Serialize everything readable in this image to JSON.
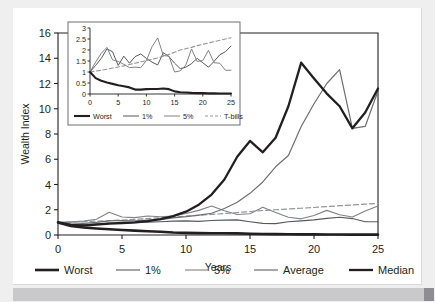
{
  "figure": {
    "background_color": "#efeff0",
    "card_color": "#ffffff",
    "footer_color": "#c9c9cc"
  },
  "chart_data": {
    "type": "line",
    "title": "",
    "xlabel": "Years",
    "ylabel": "Wealth Index",
    "xlim": [
      0,
      25
    ],
    "ylim": [
      0,
      16
    ],
    "grid": false,
    "legend_position": "bottom",
    "xticks": [
      "0",
      "5",
      "10",
      "15",
      "20",
      "25"
    ],
    "yticks": [
      "0",
      "2",
      "4",
      "6",
      "8",
      "10",
      "12",
      "14",
      "16"
    ],
    "x": [
      0,
      1,
      2,
      3,
      4,
      5,
      6,
      7,
      8,
      9,
      10,
      11,
      12,
      13,
      14,
      15,
      16,
      17,
      18,
      19,
      20,
      21,
      22,
      23,
      24,
      25
    ],
    "series": [
      {
        "name": "Worst",
        "color": "#231f20",
        "width": 2.6,
        "dash": "none",
        "values": [
          1.0,
          0.72,
          0.6,
          0.52,
          0.46,
          0.4,
          0.35,
          0.3,
          0.26,
          0.2,
          0.17,
          0.15,
          0.14,
          0.14,
          0.13,
          0.1,
          0.08,
          0.07,
          0.06,
          0.05,
          0.05,
          0.04,
          0.04,
          0.03,
          0.03,
          0.03
        ]
      },
      {
        "name": "1%",
        "color": "#58595b",
        "width": 1.1,
        "dash": "none",
        "values": [
          1.0,
          0.85,
          0.82,
          0.88,
          0.95,
          0.92,
          0.98,
          1.02,
          1.05,
          1.1,
          1.12,
          1.08,
          1.15,
          1.18,
          1.2,
          1.05,
          0.92,
          0.9,
          1.05,
          1.12,
          1.2,
          1.32,
          1.4,
          1.3,
          1.05,
          1.05
        ]
      },
      {
        "name": "5%",
        "color": "#808285",
        "width": 1.1,
        "dash": "none",
        "values": [
          1.0,
          1.05,
          1.1,
          1.25,
          1.8,
          1.42,
          1.38,
          1.5,
          1.45,
          1.5,
          1.7,
          1.95,
          2.3,
          1.92,
          1.62,
          1.68,
          2.2,
          1.78,
          1.4,
          1.28,
          1.55,
          1.95,
          1.6,
          1.42,
          1.9,
          2.3
        ]
      },
      {
        "name": "Average",
        "color": "#6d6e71",
        "width": 1.2,
        "dash": "none",
        "values": [
          1.0,
          0.95,
          0.92,
          1.0,
          1.12,
          1.15,
          1.12,
          1.18,
          1.22,
          1.35,
          1.45,
          1.58,
          1.72,
          2.1,
          2.6,
          3.3,
          4.2,
          5.4,
          6.3,
          8.6,
          10.4,
          12.0,
          13.1,
          8.45,
          8.6,
          11.4
        ]
      },
      {
        "name": "Median",
        "color": "#231f20",
        "width": 2.3,
        "dash": "none",
        "values": [
          1.0,
          0.8,
          0.75,
          0.82,
          0.9,
          0.95,
          1.0,
          1.1,
          1.25,
          1.5,
          1.85,
          2.4,
          3.2,
          4.4,
          6.2,
          7.45,
          6.55,
          7.7,
          10.2,
          13.65,
          12.4,
          11.2,
          10.2,
          8.45,
          9.7,
          11.6
        ]
      },
      {
        "name": "T-bills",
        "color": "#939598",
        "width": 1.2,
        "dash": "5,3",
        "values": [
          1.0,
          1.03,
          1.06,
          1.1,
          1.14,
          1.19,
          1.24,
          1.3,
          1.36,
          1.42,
          1.49,
          1.56,
          1.63,
          1.7,
          1.78,
          1.86,
          1.94,
          2.0,
          2.06,
          2.12,
          2.18,
          2.25,
          2.32,
          2.38,
          2.44,
          2.5
        ]
      }
    ],
    "legend": [
      {
        "label": "Worst",
        "color": "#231f20",
        "width": 2.6,
        "dash": "none"
      },
      {
        "label": "1%",
        "color": "#58595b",
        "width": 1.1,
        "dash": "none"
      },
      {
        "label": "5%",
        "color": "#808285",
        "width": 1.1,
        "dash": "none"
      },
      {
        "label": "Average",
        "color": "#6d6e71",
        "width": 1.2,
        "dash": "none"
      },
      {
        "label": "Median",
        "color": "#231f20",
        "width": 2.3,
        "dash": "none"
      },
      {
        "label": "T-bills",
        "color": "#939598",
        "width": 1.2,
        "dash": "4,2.5"
      }
    ],
    "inset": {
      "type": "line",
      "xlabel": "",
      "ylabel": "",
      "xlim": [
        0,
        25
      ],
      "ylim": [
        0,
        3
      ],
      "grid": false,
      "legend_position": "bottom",
      "xticks": [
        "0",
        "5",
        "10",
        "15",
        "20",
        "25"
      ],
      "yticks": [
        "0",
        "0.5",
        "1",
        "1.5",
        "2",
        "2.5",
        "3"
      ],
      "x": [
        0,
        1,
        2,
        3,
        4,
        5,
        6,
        7,
        8,
        9,
        10,
        11,
        12,
        13,
        14,
        15,
        16,
        17,
        18,
        19,
        20,
        21,
        22,
        23,
        24,
        25
      ],
      "series": [
        {
          "name": "Worst",
          "color": "#231f20",
          "width": 2.1,
          "dash": "none",
          "values": [
            1.0,
            0.72,
            0.6,
            0.52,
            0.46,
            0.4,
            0.35,
            0.3,
            0.2,
            0.2,
            0.22,
            0.23,
            0.23,
            0.25,
            0.22,
            0.12,
            0.08,
            0.07,
            0.05,
            0.04,
            0.04,
            0.03,
            0.03,
            0.02,
            0.02,
            0.02
          ]
        },
        {
          "name": "1%",
          "color": "#58595b",
          "width": 1.0,
          "dash": "none",
          "values": [
            1.0,
            1.3,
            1.62,
            2.05,
            1.92,
            1.3,
            1.72,
            1.4,
            1.7,
            1.82,
            1.62,
            1.45,
            1.32,
            1.88,
            1.7,
            1.4,
            1.15,
            1.22,
            1.38,
            1.62,
            1.42,
            1.22,
            1.48,
            1.78,
            1.92,
            2.18
          ]
        },
        {
          "name": "5%",
          "color": "#808285",
          "width": 1.0,
          "dash": "none",
          "values": [
            1.0,
            1.45,
            1.85,
            2.12,
            1.55,
            1.48,
            1.35,
            1.2,
            1.22,
            1.2,
            1.52,
            2.15,
            2.55,
            1.75,
            1.72,
            1.0,
            1.05,
            1.32,
            2.05,
            1.48,
            1.52,
            1.98,
            1.42,
            1.4,
            1.08,
            1.08
          ]
        },
        {
          "name": "T-bills",
          "color": "#939598",
          "width": 1.1,
          "dash": "4,2.5",
          "values": [
            1.0,
            1.04,
            1.08,
            1.13,
            1.18,
            1.23,
            1.28,
            1.34,
            1.4,
            1.46,
            1.52,
            1.58,
            1.64,
            1.72,
            1.8,
            1.9,
            2.0,
            2.06,
            2.12,
            2.2,
            2.26,
            2.32,
            2.38,
            2.44,
            2.5,
            2.56
          ]
        }
      ],
      "legend": [
        {
          "label": "Worst",
          "color": "#231f20",
          "width": 2.1,
          "dash": "none"
        },
        {
          "label": "1%",
          "color": "#58595b",
          "width": 1.0,
          "dash": "none"
        },
        {
          "label": "5%",
          "color": "#808285",
          "width": 1.0,
          "dash": "none"
        },
        {
          "label": "T-bills",
          "color": "#939598",
          "width": 1.1,
          "dash": "3,2"
        }
      ]
    }
  }
}
